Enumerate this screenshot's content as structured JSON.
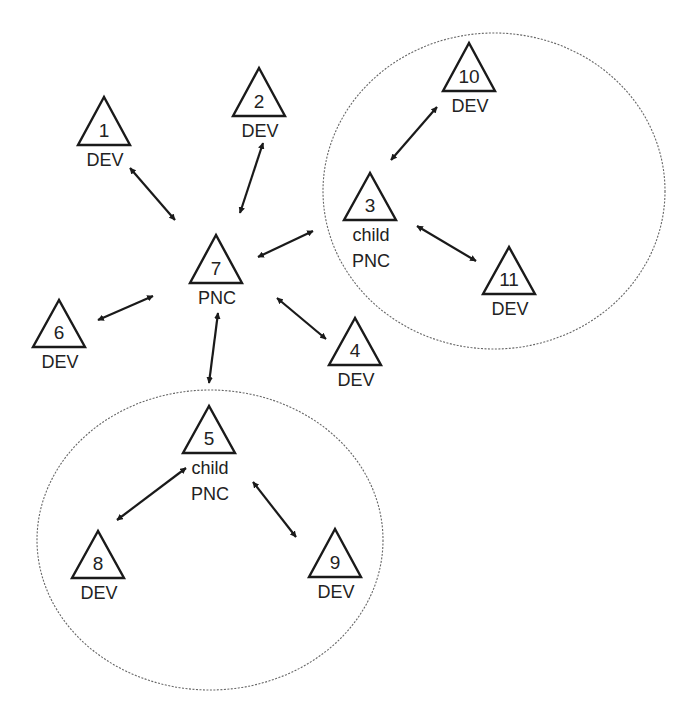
{
  "diagram": {
    "type": "network-topology",
    "colors": {
      "stroke": "#1a1a1a",
      "text": "#222222",
      "cluster": "#666666",
      "background": "#ffffff"
    },
    "clusters": [
      {
        "id": "cluster-3",
        "cx": 494,
        "cy": 191,
        "rx": 171,
        "ry": 158,
        "members": [
          "3",
          "10",
          "11"
        ]
      },
      {
        "id": "cluster-5",
        "cx": 210,
        "cy": 540,
        "rx": 173,
        "ry": 150,
        "members": [
          "5",
          "8",
          "9"
        ]
      }
    ],
    "nodes": [
      {
        "id": "1",
        "number": "1",
        "label": [
          "DEV"
        ],
        "x": 104,
        "apex": 97,
        "base": 145,
        "half": 26
      },
      {
        "id": "2",
        "number": "2",
        "label": [
          "DEV"
        ],
        "x": 259,
        "apex": 68,
        "base": 116,
        "half": 26
      },
      {
        "id": "3",
        "number": "3",
        "label": [
          "child",
          "PNC"
        ],
        "x": 370,
        "apex": 173,
        "base": 220,
        "half": 26
      },
      {
        "id": "4",
        "number": "4",
        "label": [
          "DEV"
        ],
        "x": 355,
        "apex": 318,
        "base": 365,
        "half": 26
      },
      {
        "id": "5",
        "number": "5",
        "label": [
          "child",
          "PNC"
        ],
        "x": 209,
        "apex": 406,
        "base": 453,
        "half": 26
      },
      {
        "id": "6",
        "number": "6",
        "label": [
          "DEV"
        ],
        "x": 59,
        "apex": 300,
        "base": 347,
        "half": 26
      },
      {
        "id": "7",
        "number": "7",
        "label": [
          "PNC"
        ],
        "x": 216,
        "apex": 235,
        "base": 283,
        "half": 26
      },
      {
        "id": "8",
        "number": "8",
        "label": [
          "DEV"
        ],
        "x": 98,
        "apex": 531,
        "base": 578,
        "half": 26
      },
      {
        "id": "9",
        "number": "9",
        "label": [
          "DEV"
        ],
        "x": 335,
        "apex": 529,
        "base": 577,
        "half": 26
      },
      {
        "id": "10",
        "number": "10",
        "label": [
          "DEV"
        ],
        "x": 469,
        "apex": 43,
        "base": 91,
        "half": 26
      },
      {
        "id": "11",
        "number": "11",
        "label": [
          "DEV"
        ],
        "x": 509,
        "apex": 247,
        "base": 294,
        "half": 26
      }
    ],
    "edges": [
      {
        "from": "1",
        "to": "7",
        "bidirectional": true,
        "x1": 130,
        "y1": 168,
        "x2": 175,
        "y2": 220
      },
      {
        "from": "2",
        "to": "7",
        "bidirectional": true,
        "x1": 263,
        "y1": 143,
        "x2": 240,
        "y2": 213
      },
      {
        "from": "7",
        "to": "3",
        "bidirectional": true,
        "x1": 258,
        "y1": 257,
        "x2": 313,
        "y2": 231
      },
      {
        "from": "6",
        "to": "7",
        "bidirectional": true,
        "x1": 98,
        "y1": 320,
        "x2": 153,
        "y2": 296
      },
      {
        "from": "7",
        "to": "4",
        "bidirectional": true,
        "x1": 277,
        "y1": 298,
        "x2": 326,
        "y2": 339
      },
      {
        "from": "7",
        "to": "5",
        "bidirectional": true,
        "x1": 218,
        "y1": 313,
        "x2": 209,
        "y2": 383
      },
      {
        "from": "3",
        "to": "10",
        "bidirectional": true,
        "x1": 391,
        "y1": 160,
        "x2": 437,
        "y2": 107
      },
      {
        "from": "3",
        "to": "11",
        "bidirectional": true,
        "x1": 417,
        "y1": 226,
        "x2": 476,
        "y2": 261
      },
      {
        "from": "5",
        "to": "8",
        "bidirectional": true,
        "x1": 186,
        "y1": 468,
        "x2": 117,
        "y2": 520
      },
      {
        "from": "5",
        "to": "9",
        "bidirectional": true,
        "x1": 253,
        "y1": 482,
        "x2": 296,
        "y2": 537
      }
    ]
  }
}
